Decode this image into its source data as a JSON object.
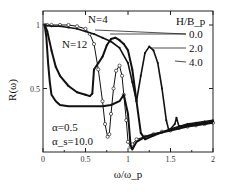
{
  "chart_data": {
    "type": "line",
    "title": "",
    "xlabel": "ω/ω_p",
    "ylabel": "R(ω)",
    "xlim": [
      0,
      2
    ],
    "ylim": [
      0,
      1.1
    ],
    "x_ticks": [
      "0",
      "0.5",
      "1",
      "1.5",
      "2"
    ],
    "y_ticks": [
      "0.5",
      "1"
    ],
    "grid": false,
    "legend_title": "H/B_p",
    "legend_placement": "top-right",
    "annotations": {
      "n4": "N=4",
      "n12": "N=12",
      "alpha": "α=0.5",
      "alpha_s": "α_s=10.0"
    },
    "series": [
      {
        "name": "N=4, H/B_p=0.0",
        "marker": "circle",
        "x": [
          0.02,
          0.05,
          0.1,
          0.2,
          0.3,
          0.4,
          0.5,
          0.55,
          0.6,
          0.65,
          0.7,
          0.73,
          0.76,
          0.78,
          0.8,
          0.83,
          0.86,
          0.9,
          0.93,
          0.95,
          0.98,
          1.0,
          1.03,
          1.05,
          1.1,
          1.2,
          1.3,
          1.4,
          1.5,
          1.6,
          1.7,
          1.8,
          1.9,
          2.0
        ],
        "y": [
          1.0,
          1.0,
          1.0,
          1.0,
          1.0,
          0.99,
          0.97,
          0.93,
          0.85,
          0.65,
          0.4,
          0.22,
          0.12,
          0.14,
          0.3,
          0.5,
          0.64,
          0.68,
          0.6,
          0.45,
          0.25,
          0.08,
          0.04,
          0.06,
          0.1,
          0.12,
          0.14,
          0.16,
          0.17,
          0.19,
          0.2,
          0.21,
          0.22,
          0.23
        ]
      },
      {
        "name": "N=12, H/B_p=0.0",
        "marker": "none",
        "x": [
          0.02,
          0.04,
          0.06,
          0.08,
          0.1,
          0.15,
          0.2,
          0.3,
          0.4,
          0.5,
          0.6,
          0.7,
          0.8,
          0.9,
          0.95,
          1.0,
          1.03,
          1.05,
          1.1,
          1.2,
          1.3,
          1.5,
          1.7,
          2.0
        ],
        "y": [
          1.0,
          0.9,
          0.7,
          0.55,
          0.45,
          0.4,
          0.37,
          0.36,
          0.36,
          0.36,
          0.36,
          0.36,
          0.37,
          0.4,
          0.45,
          0.3,
          0.05,
          0.02,
          0.08,
          0.12,
          0.14,
          0.17,
          0.2,
          0.23
        ]
      },
      {
        "name": "H/B_p=2.0",
        "marker": "small-dot",
        "x": [
          0.02,
          0.05,
          0.1,
          0.15,
          0.2,
          0.3,
          0.4,
          0.5,
          0.55,
          0.58,
          0.6,
          0.65,
          0.7,
          0.75,
          0.8,
          0.85,
          0.9,
          0.95,
          1.0,
          1.05,
          1.1,
          1.15,
          1.2,
          1.3,
          1.5,
          1.6,
          1.8,
          2.0
        ],
        "y": [
          1.0,
          0.95,
          0.8,
          0.67,
          0.6,
          0.52,
          0.47,
          0.45,
          0.44,
          0.46,
          0.65,
          0.7,
          0.75,
          0.84,
          0.89,
          0.9,
          0.88,
          0.85,
          0.8,
          0.65,
          0.4,
          0.15,
          0.1,
          0.13,
          0.18,
          0.2,
          0.22,
          0.24
        ]
      },
      {
        "name": "H/B_p=4.0",
        "marker": "small-dot",
        "x": [
          0.02,
          0.1,
          0.2,
          0.3,
          0.4,
          0.5,
          0.6,
          0.7,
          0.8,
          0.9,
          1.0,
          1.05,
          1.1,
          1.15,
          1.2,
          1.25,
          1.3,
          1.35,
          1.4,
          1.45,
          1.48,
          1.5,
          1.55,
          1.57,
          1.6,
          1.7,
          1.8,
          1.9,
          2.0
        ],
        "y": [
          1.0,
          0.99,
          0.99,
          0.98,
          0.97,
          0.95,
          0.93,
          0.9,
          0.87,
          0.82,
          0.7,
          0.55,
          0.4,
          0.6,
          0.78,
          0.83,
          0.8,
          0.7,
          0.5,
          0.25,
          0.17,
          0.18,
          0.22,
          0.27,
          0.2,
          0.22,
          0.23,
          0.24,
          0.25
        ]
      }
    ]
  }
}
